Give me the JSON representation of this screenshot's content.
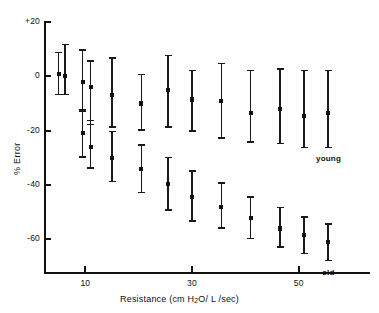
{
  "chart_data": {
    "type": "scatter",
    "title": "",
    "xlabel": "Resistance (cm H2O/L/sec)",
    "xlabel_parts": {
      "pre": "Resistance (cm H",
      "sub": "2",
      "post": "O/ L /sec)"
    },
    "ylabel": "% Error",
    "xlim": [
      3,
      60
    ],
    "ylim": [
      -72,
      20
    ],
    "xticks": [
      10,
      30,
      50
    ],
    "xticklabels": [
      "10",
      "30",
      "50"
    ],
    "yticks": [
      20,
      0,
      -20,
      -40,
      -60
    ],
    "yticklabels": [
      "+20",
      "0",
      "-20",
      "-40",
      "-60"
    ],
    "grid": false,
    "legend_position": "inline-annotation",
    "error_bar_style": "mean with capped vertical error bars",
    "series": [
      {
        "name": "young",
        "label_text": "young",
        "points": [
          {
            "x": 5.0,
            "y": 1.0,
            "err_low": 8.0,
            "err_high": 8.0
          },
          {
            "x": 6.2,
            "y": 0.0,
            "err_low": 7.0,
            "err_high": 12.0
          },
          {
            "x": 9.5,
            "y": -2.0,
            "err_low": 11.0,
            "err_high": 12.0
          },
          {
            "x": 11.0,
            "y": -4.0,
            "err_low": 14.0,
            "err_high": 10.0
          },
          {
            "x": 15.0,
            "y": -7.0,
            "err_low": 12.0,
            "err_high": 14.0
          },
          {
            "x": 20.5,
            "y": -10.0,
            "err_low": 10.0,
            "err_high": 11.0
          },
          {
            "x": 25.5,
            "y": -5.0,
            "err_low": 14.0,
            "err_high": 13.0
          },
          {
            "x": 30.0,
            "y": -8.5,
            "err_low": 12.0,
            "err_high": 11.0
          },
          {
            "x": 35.5,
            "y": -9.0,
            "err_low": 14.0,
            "err_high": 14.0
          },
          {
            "x": 41.0,
            "y": -13.5,
            "err_low": 11.0,
            "err_high": 16.0
          },
          {
            "x": 46.5,
            "y": -12.0,
            "err_low": 13.0,
            "err_high": 15.0
          },
          {
            "x": 51.0,
            "y": -14.5,
            "err_low": 12.0,
            "err_high": 17.0
          },
          {
            "x": 55.5,
            "y": -13.5,
            "err_low": 13.0,
            "err_high": 16.0
          }
        ]
      },
      {
        "name": "old",
        "label_text": "old",
        "points": [
          {
            "x": 9.5,
            "y": -21.0,
            "err_low": 9.0,
            "err_high": 9.0
          },
          {
            "x": 11.0,
            "y": -26.0,
            "err_low": 8.0,
            "err_high": 10.0
          },
          {
            "x": 15.0,
            "y": -30.0,
            "err_low": 9.0,
            "err_high": 10.0
          },
          {
            "x": 20.5,
            "y": -34.0,
            "err_low": 9.0,
            "err_high": 9.0
          },
          {
            "x": 25.5,
            "y": -39.5,
            "err_low": 10.0,
            "err_high": 10.0
          },
          {
            "x": 30.0,
            "y": -44.5,
            "err_low": 9.0,
            "err_high": 10.0
          },
          {
            "x": 35.5,
            "y": -48.0,
            "err_low": 8.0,
            "err_high": 9.0
          },
          {
            "x": 41.0,
            "y": -52.0,
            "err_low": 8.0,
            "err_high": 8.0
          },
          {
            "x": 46.5,
            "y": -56.0,
            "err_low": 7.0,
            "err_high": 8.0
          },
          {
            "x": 51.0,
            "y": -58.5,
            "err_low": 7.0,
            "err_high": 7.0
          },
          {
            "x": 55.5,
            "y": -61.0,
            "err_low": 7.0,
            "err_high": 7.0
          }
        ]
      }
    ]
  }
}
